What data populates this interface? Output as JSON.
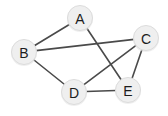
{
  "figure": {
    "background_color": "#ffffff",
    "width": 168,
    "height": 116
  },
  "chart_data": {
    "type": "diagram",
    "diagram_kind": "undirected-graph",
    "title": "",
    "node_count": 5,
    "edge_count": 7,
    "node_fill_color": "#efefef",
    "node_stroke_color": "#dcdcdc",
    "node_label_color": "#1c1c1c",
    "edge_color": "#4a4a4a",
    "edge_width": 1.6,
    "node_radius": 13,
    "nodes": [
      {
        "id": "A",
        "label": "A",
        "x": 80,
        "y": 18
      },
      {
        "id": "B",
        "label": "B",
        "x": 24,
        "y": 52
      },
      {
        "id": "C",
        "label": "C",
        "x": 146,
        "y": 38
      },
      {
        "id": "D",
        "label": "D",
        "x": 74,
        "y": 92
      },
      {
        "id": "E",
        "label": "E",
        "x": 128,
        "y": 90
      }
    ],
    "edges": [
      {
        "id": "A-B",
        "source": "A",
        "target": "B",
        "label": ""
      },
      {
        "id": "A-E",
        "source": "A",
        "target": "E",
        "label": ""
      },
      {
        "id": "B-C",
        "source": "B",
        "target": "C",
        "label": ""
      },
      {
        "id": "B-D",
        "source": "B",
        "target": "D",
        "label": ""
      },
      {
        "id": "C-D",
        "source": "C",
        "target": "D",
        "label": ""
      },
      {
        "id": "C-E",
        "source": "C",
        "target": "E",
        "label": ""
      },
      {
        "id": "D-E",
        "source": "D",
        "target": "E",
        "label": ""
      }
    ],
    "adjacency": {
      "A": [
        "B",
        "E"
      ],
      "B": [
        "A",
        "C",
        "D"
      ],
      "C": [
        "B",
        "D",
        "E"
      ],
      "D": [
        "B",
        "C",
        "E"
      ],
      "E": [
        "A",
        "C",
        "D"
      ]
    },
    "degrees": {
      "A": 2,
      "B": 3,
      "C": 3,
      "D": 3,
      "E": 3
    }
  }
}
